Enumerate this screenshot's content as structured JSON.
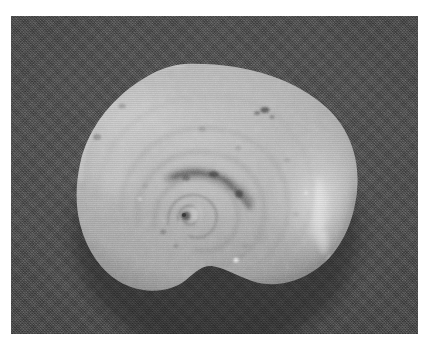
{
  "image": {
    "kind": "photograph",
    "subject": "gastropod-shell",
    "description": "Black and white photograph of a flat-coiled planispiral snail shell (apertural/apical view) lying on a dark woven cloth background",
    "caption": "",
    "orientation": "landscape",
    "width": 429,
    "height": 350
  },
  "plate": {
    "left": 11,
    "top": 16,
    "width": 407,
    "height": 318,
    "page_background": "#ffffff",
    "background_color": "#3c3c3c",
    "background_texture": "dark woven fabric"
  },
  "shell": {
    "label": "snail-shell",
    "base_color": "#ababab",
    "highlight_color": "#dcdcdc",
    "shadow_color": "#7e7e7e",
    "outline_notch": "bottom-right aperture notch",
    "center": {
      "x": 185,
      "y": 215
    },
    "bounds": {
      "left": 78,
      "top": 63,
      "right": 358,
      "bottom": 293
    },
    "features": [
      {
        "name": "spiral-nucleus",
        "x": 185,
        "y": 215
      },
      {
        "name": "whorl-ring-inner",
        "x": 185,
        "y": 214
      },
      {
        "name": "whorl-ring-outer",
        "x": 195,
        "y": 210
      },
      {
        "name": "dark-suture-band",
        "x": 200,
        "y": 182
      },
      {
        "name": "body-whorl-highlight",
        "x": 320,
        "y": 212
      },
      {
        "name": "upper-left-rim-highlight",
        "x": 135,
        "y": 120
      },
      {
        "name": "dark-speck-upper",
        "x": 265,
        "y": 110
      },
      {
        "name": "dark-speck-left",
        "x": 97,
        "y": 137
      },
      {
        "name": "aperture-notch",
        "x": 250,
        "y": 282
      }
    ]
  },
  "colors": {
    "page": "#ffffff",
    "background": "#3c3c3c",
    "shell_light": "#c9c9c9",
    "shell_mid": "#a9a9a9",
    "shell_dark": "#8a8a8a"
  }
}
